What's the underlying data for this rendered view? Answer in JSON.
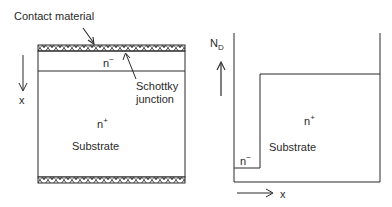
{
  "left_diagram": {
    "contact_label": "Contact material",
    "layer_top_label": "n",
    "layer_top_sup": "−",
    "junction_label_line1": "Schottky",
    "junction_label_line2": "junction",
    "substrate_doping_label": "n",
    "substrate_doping_sup": "+",
    "substrate_label": "Substrate",
    "axis_label": "x",
    "axis_direction": "down"
  },
  "right_diagram": {
    "y_axis_label": "N",
    "y_axis_sub": "D",
    "x_axis_label": "x",
    "low_region_label": "n",
    "low_region_sup": "−",
    "high_region_label": "n",
    "high_region_sup": "+",
    "substrate_label": "Substrate",
    "profile": [
      {
        "region": "n-",
        "x_start": 0,
        "x_end": 0.18,
        "level": "low"
      },
      {
        "region": "n+",
        "x_start": 0.18,
        "x_end": 1.0,
        "level": "high"
      }
    ]
  },
  "colors": {
    "line": "#2a2a2a",
    "background": "#ffffff"
  }
}
